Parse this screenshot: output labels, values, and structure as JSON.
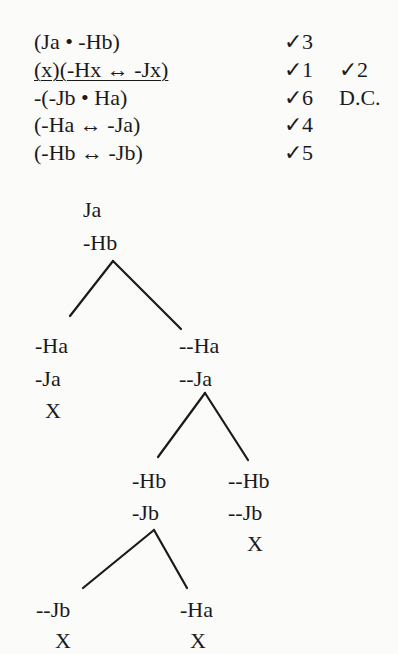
{
  "premises": [
    {
      "formula": "(Ja • -Hb)",
      "checks": "✓3",
      "note": ""
    },
    {
      "formula": "(x)(-Hx ↔ -Jx)",
      "checks": "✓1",
      "checks2": "✓2",
      "note": ""
    },
    {
      "formula": "-(-Jb • Ha)",
      "checks": "✓6",
      "note": "D.C."
    },
    {
      "formula": "(-Ha ↔ -Ja)",
      "checks": "✓4",
      "note": ""
    },
    {
      "formula": "(-Hb ↔ -Jb)",
      "checks": "✓5",
      "note": ""
    }
  ],
  "tree": {
    "trunk": [
      "Ja",
      "-Hb"
    ],
    "branch_left": [
      "-Ha",
      "-Ja",
      "X"
    ],
    "branch_right": [
      "--Ha",
      "--Ja"
    ],
    "branch_right_left": [
      "-Hb",
      "-Jb"
    ],
    "branch_right_right": [
      "--Hb",
      "--Jb",
      "X"
    ],
    "leaf_left": [
      "--Jb",
      "X"
    ],
    "leaf_right": [
      "-Ha",
      "X"
    ]
  }
}
